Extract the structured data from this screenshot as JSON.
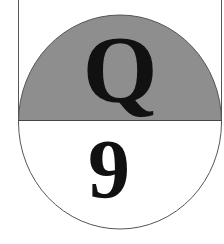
{
  "badge": {
    "top_letter": "Q",
    "bottom_number": "9",
    "colors": {
      "top_fill": "#8e8e8e",
      "bottom_fill": "#ffffff",
      "stroke": "#444444",
      "text": "#111111"
    }
  }
}
